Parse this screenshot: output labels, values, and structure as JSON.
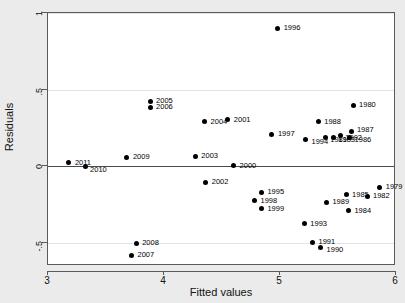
{
  "chart_data": {
    "type": "scatter",
    "title": "",
    "xlabel": "Fitted values",
    "ylabel": "Residuals",
    "xlim": [
      3,
      6
    ],
    "ylim": [
      -0.65,
      1.0
    ],
    "xticks": [
      "3",
      "4",
      "5",
      "6"
    ],
    "xtick_values": [
      3,
      4,
      5,
      6
    ],
    "yticks": [
      "1",
      ".5",
      "0",
      "-.5"
    ],
    "ytick_values": [
      1,
      0.5,
      0,
      -0.5
    ],
    "grid": true,
    "gridlines_y": [
      1,
      0.5,
      -0.5
    ],
    "zero_reference_line": 0,
    "legend": "none",
    "marker_color": "#000000",
    "plot_background": "#ffffff",
    "figure_background": "#ebebeb",
    "point_label_field": "year",
    "points": [
      {
        "label": "2011",
        "x": 3.18,
        "y": 0.025,
        "lx": 6,
        "ly": -4
      },
      {
        "label": "2010",
        "x": 3.32,
        "y": 0.0,
        "lx": 5,
        "ly": 0
      },
      {
        "label": "2009",
        "x": 3.68,
        "y": 0.06,
        "lx": 6,
        "ly": -4
      },
      {
        "label": "2007",
        "x": 3.72,
        "y": -0.58,
        "lx": 6,
        "ly": -4
      },
      {
        "label": "2008",
        "x": 3.76,
        "y": -0.5,
        "lx": 6,
        "ly": -4
      },
      {
        "label": "2005",
        "x": 3.88,
        "y": 0.425,
        "lx": 6,
        "ly": -4
      },
      {
        "label": "2006",
        "x": 3.88,
        "y": 0.385,
        "lx": 6,
        "ly": -4
      },
      {
        "label": "2003",
        "x": 4.27,
        "y": 0.065,
        "lx": 6,
        "ly": -4
      },
      {
        "label": "2002",
        "x": 4.36,
        "y": -0.105,
        "lx": 6,
        "ly": -4
      },
      {
        "label": "2004",
        "x": 4.35,
        "y": 0.29,
        "lx": 6,
        "ly": -4
      },
      {
        "label": "2001",
        "x": 4.55,
        "y": 0.305,
        "lx": 6,
        "ly": -4
      },
      {
        "label": "2000",
        "x": 4.6,
        "y": 0.005,
        "lx": 6,
        "ly": -4
      },
      {
        "label": "1998",
        "x": 4.78,
        "y": -0.225,
        "lx": 6,
        "ly": -4
      },
      {
        "label": "1995",
        "x": 4.84,
        "y": -0.17,
        "lx": 6,
        "ly": -4
      },
      {
        "label": "1999",
        "x": 4.84,
        "y": -0.275,
        "lx": 6,
        "ly": -4
      },
      {
        "label": "1997",
        "x": 4.93,
        "y": 0.21,
        "lx": 6,
        "ly": -4
      },
      {
        "label": "1996",
        "x": 4.98,
        "y": 0.9,
        "lx": 6,
        "ly": -4
      },
      {
        "label": "1993",
        "x": 5.21,
        "y": -0.375,
        "lx": 6,
        "ly": -4
      },
      {
        "label": "1994",
        "x": 5.22,
        "y": 0.175,
        "lx": 6,
        "ly": -2
      },
      {
        "label": "1991",
        "x": 5.28,
        "y": -0.495,
        "lx": 6,
        "ly": -4
      },
      {
        "label": "1988",
        "x": 5.33,
        "y": 0.29,
        "lx": 6,
        "ly": -4
      },
      {
        "label": "1990",
        "x": 5.35,
        "y": -0.53,
        "lx": 6,
        "ly": -2
      },
      {
        "label": "1981",
        "x": 5.39,
        "y": 0.185,
        "lx": 5,
        "ly": -2
      },
      {
        "label": "1989",
        "x": 5.4,
        "y": -0.235,
        "lx": 6,
        "ly": -4
      },
      {
        "label": "1983",
        "x": 5.46,
        "y": 0.185,
        "lx": 5,
        "ly": -2
      },
      {
        "label": "1992",
        "x": 5.52,
        "y": 0.2,
        "lx": 5,
        "ly": -2
      },
      {
        "label": "1985",
        "x": 5.57,
        "y": -0.185,
        "lx": 6,
        "ly": -4
      },
      {
        "label": "1984",
        "x": 5.59,
        "y": -0.29,
        "lx": 6,
        "ly": -4
      },
      {
        "label": "1986",
        "x": 5.6,
        "y": 0.19,
        "lx": 5,
        "ly": -1
      },
      {
        "label": "1987",
        "x": 5.62,
        "y": 0.225,
        "lx": 5,
        "ly": -6
      },
      {
        "label": "1980",
        "x": 5.63,
        "y": 0.4,
        "lx": 6,
        "ly": -4
      },
      {
        "label": "1982",
        "x": 5.75,
        "y": -0.195,
        "lx": 6,
        "ly": -4
      },
      {
        "label": "1979",
        "x": 5.86,
        "y": -0.135,
        "lx": 6,
        "ly": -4
      }
    ]
  }
}
